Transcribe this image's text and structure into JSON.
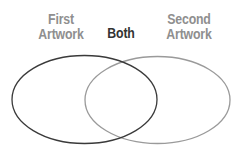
{
  "diagram": {
    "type": "venn",
    "labels": {
      "first": [
        "First",
        "Artwork"
      ],
      "both": "Both",
      "second": [
        "Second",
        "Artwork"
      ]
    },
    "sets": [
      {
        "name": "First Artwork",
        "stroke": "#3a3a3a"
      },
      {
        "name": "Second Artwork",
        "stroke": "#9a9a9a"
      }
    ],
    "intersection_label": "Both"
  }
}
